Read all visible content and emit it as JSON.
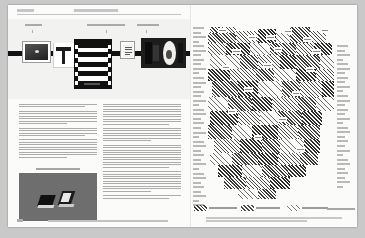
{
  "document": {
    "type": "printed-journal-spread",
    "page_number": "108",
    "running_header_left": "Chapter 04",
    "running_header_center": "Interface as Artifact",
    "footer_text": "Design Research Quarterly — Volume 12, Number 3 — Material Histories of the Interface",
    "background_color": "#c9c9c9",
    "paper_color": "#fbfbfa",
    "ink_color": "#111111"
  },
  "left_page": {
    "timeline": {
      "name": "artifact-timeline-strip",
      "axis_color": "#111111",
      "labels": [
        {
          "text": "1946-58",
          "x": 17
        },
        {
          "text": "1959-72 · transition era",
          "x": 79
        },
        {
          "text": "1973-84",
          "x": 129
        }
      ],
      "items": [
        {
          "name": "framed-photograph",
          "caption": "Plate 1"
        },
        {
          "name": "t-shaped-object",
          "caption": "Plate 2"
        },
        {
          "name": "striped-panel",
          "caption": "Plate 3"
        },
        {
          "name": "index-card",
          "caption": "Plate 4"
        },
        {
          "name": "device-photograph",
          "caption": "Plate 5"
        }
      ]
    },
    "columns": [
      {
        "name": "body-column-left",
        "paragraphs": [
          {
            "lines": 2,
            "last": "mid"
          },
          {
            "lines": 6,
            "last": "short"
          },
          {
            "lines": 4,
            "last": "mid"
          },
          {
            "lines": 8,
            "last": "short"
          }
        ]
      },
      {
        "name": "body-column-right",
        "paragraphs": [
          {
            "lines": 9,
            "last": "mid"
          },
          {
            "lines": 6,
            "last": "short"
          },
          {
            "lines": 10,
            "last": "mid"
          },
          {
            "lines": 9,
            "last": "short"
          },
          {
            "lines": 2,
            "last": "mid"
          }
        ]
      }
    ],
    "figure": {
      "name": "figure-photograph",
      "caption": "Figure 4.2 — Comparative housings",
      "background_color": "#6e6e6e"
    }
  },
  "right_page": {
    "matrix": {
      "name": "hatched-matrix-diagram",
      "row_label_count": 40,
      "right_label_count": 32
    },
    "legend": {
      "items": [
        {
          "label": "Primary sequence",
          "density": "dense"
        },
        {
          "label": "Secondary set",
          "density": "medium"
        },
        {
          "label": "Peripheral range",
          "density": "light"
        }
      ],
      "right_note": "Source: author survey"
    },
    "caption": "Figure 4.3 — Distribution matrix of recorded artifact types across the survey period, grouped by production cohort."
  },
  "chart_data": {
    "type": "heatmap",
    "xlabel": "",
    "ylabel": "",
    "grid": false,
    "legend_position": "bottom-left",
    "legend": [
      "Primary sequence",
      "Secondary set",
      "Peripheral range"
    ],
    "cells": [
      {
        "x": 2,
        "y": 0,
        "w": 10,
        "h": 6,
        "d": "d2"
      },
      {
        "x": 12,
        "y": 0,
        "w": 16,
        "h": 6,
        "d": ""
      },
      {
        "x": 0,
        "y": 6,
        "w": 28,
        "h": 10,
        "d": "d2"
      },
      {
        "x": 28,
        "y": 4,
        "w": 22,
        "h": 12,
        "d": ""
      },
      {
        "x": 50,
        "y": 2,
        "w": 18,
        "h": 14,
        "d": "d3"
      },
      {
        "x": 68,
        "y": 6,
        "w": 14,
        "h": 10,
        "d": "lite"
      },
      {
        "x": 82,
        "y": 0,
        "w": 20,
        "h": 16,
        "d": "d2"
      },
      {
        "x": 102,
        "y": 4,
        "w": 16,
        "h": 12,
        "d": ""
      },
      {
        "x": 0,
        "y": 16,
        "w": 18,
        "h": 12,
        "d": ""
      },
      {
        "x": 18,
        "y": 16,
        "w": 24,
        "h": 12,
        "d": "d3"
      },
      {
        "x": 42,
        "y": 16,
        "w": 20,
        "h": 12,
        "d": "lite"
      },
      {
        "x": 62,
        "y": 16,
        "w": 26,
        "h": 12,
        "d": "d2"
      },
      {
        "x": 88,
        "y": 16,
        "w": 18,
        "h": 12,
        "d": ""
      },
      {
        "x": 106,
        "y": 16,
        "w": 18,
        "h": 12,
        "d": "d3"
      },
      {
        "x": 2,
        "y": 28,
        "w": 30,
        "h": 14,
        "d": "lite"
      },
      {
        "x": 32,
        "y": 28,
        "w": 18,
        "h": 14,
        "d": "d2"
      },
      {
        "x": 50,
        "y": 28,
        "w": 22,
        "h": 14,
        "d": ""
      },
      {
        "x": 72,
        "y": 28,
        "w": 16,
        "h": 14,
        "d": "d3"
      },
      {
        "x": 88,
        "y": 28,
        "w": 24,
        "h": 14,
        "d": "d2"
      },
      {
        "x": 112,
        "y": 28,
        "w": 14,
        "h": 14,
        "d": "lite"
      },
      {
        "x": 0,
        "y": 42,
        "w": 22,
        "h": 12,
        "d": "d3"
      },
      {
        "x": 22,
        "y": 42,
        "w": 26,
        "h": 12,
        "d": ""
      },
      {
        "x": 48,
        "y": 42,
        "w": 18,
        "h": 12,
        "d": "d2"
      },
      {
        "x": 66,
        "y": 42,
        "w": 22,
        "h": 12,
        "d": "lite"
      },
      {
        "x": 88,
        "y": 42,
        "w": 20,
        "h": 12,
        "d": "d3"
      },
      {
        "x": 108,
        "y": 42,
        "w": 18,
        "h": 12,
        "d": ""
      },
      {
        "x": 4,
        "y": 54,
        "w": 26,
        "h": 16,
        "d": "d2"
      },
      {
        "x": 30,
        "y": 54,
        "w": 20,
        "h": 16,
        "d": "d3"
      },
      {
        "x": 50,
        "y": 54,
        "w": 24,
        "h": 16,
        "d": "lite"
      },
      {
        "x": 74,
        "y": 54,
        "w": 18,
        "h": 16,
        "d": "d2"
      },
      {
        "x": 92,
        "y": 54,
        "w": 22,
        "h": 16,
        "d": ""
      },
      {
        "x": 114,
        "y": 54,
        "w": 12,
        "h": 16,
        "d": "d3"
      },
      {
        "x": 0,
        "y": 70,
        "w": 20,
        "h": 14,
        "d": "lite"
      },
      {
        "x": 20,
        "y": 70,
        "w": 24,
        "h": 14,
        "d": "d2"
      },
      {
        "x": 44,
        "y": 70,
        "w": 20,
        "h": 14,
        "d": "d3"
      },
      {
        "x": 64,
        "y": 70,
        "w": 26,
        "h": 14,
        "d": ""
      },
      {
        "x": 90,
        "y": 70,
        "w": 18,
        "h": 14,
        "d": "d2"
      },
      {
        "x": 108,
        "y": 70,
        "w": 18,
        "h": 14,
        "d": "lite"
      },
      {
        "x": 2,
        "y": 84,
        "w": 28,
        "h": 14,
        "d": "d3"
      },
      {
        "x": 30,
        "y": 84,
        "w": 22,
        "h": 14,
        "d": ""
      },
      {
        "x": 52,
        "y": 84,
        "w": 18,
        "h": 14,
        "d": "lite"
      },
      {
        "x": 70,
        "y": 84,
        "w": 24,
        "h": 14,
        "d": "d2"
      },
      {
        "x": 94,
        "y": 84,
        "w": 20,
        "h": 14,
        "d": "d3"
      },
      {
        "x": 0,
        "y": 98,
        "w": 24,
        "h": 14,
        "d": "d2"
      },
      {
        "x": 24,
        "y": 98,
        "w": 20,
        "h": 14,
        "d": "lite"
      },
      {
        "x": 44,
        "y": 98,
        "w": 26,
        "h": 14,
        "d": "d3"
      },
      {
        "x": 70,
        "y": 98,
        "w": 20,
        "h": 14,
        "d": ""
      },
      {
        "x": 90,
        "y": 98,
        "w": 22,
        "h": 14,
        "d": "d2"
      },
      {
        "x": 6,
        "y": 112,
        "w": 26,
        "h": 14,
        "d": ""
      },
      {
        "x": 32,
        "y": 112,
        "w": 22,
        "h": 14,
        "d": "d3"
      },
      {
        "x": 54,
        "y": 112,
        "w": 18,
        "h": 14,
        "d": "d2"
      },
      {
        "x": 72,
        "y": 112,
        "w": 24,
        "h": 14,
        "d": "lite"
      },
      {
        "x": 96,
        "y": 112,
        "w": 16,
        "h": 14,
        "d": "d3"
      },
      {
        "x": 2,
        "y": 126,
        "w": 22,
        "h": 12,
        "d": "lite"
      },
      {
        "x": 24,
        "y": 126,
        "w": 26,
        "h": 12,
        "d": "d2"
      },
      {
        "x": 50,
        "y": 126,
        "w": 20,
        "h": 12,
        "d": "d3"
      },
      {
        "x": 70,
        "y": 126,
        "w": 22,
        "h": 12,
        "d": ""
      },
      {
        "x": 92,
        "y": 126,
        "w": 18,
        "h": 12,
        "d": "d2"
      },
      {
        "x": 10,
        "y": 138,
        "w": 24,
        "h": 12,
        "d": "d3"
      },
      {
        "x": 34,
        "y": 138,
        "w": 20,
        "h": 12,
        "d": "lite"
      },
      {
        "x": 54,
        "y": 138,
        "w": 26,
        "h": 12,
        "d": "d2"
      },
      {
        "x": 80,
        "y": 138,
        "w": 18,
        "h": 12,
        "d": "d3"
      },
      {
        "x": 16,
        "y": 150,
        "w": 22,
        "h": 12,
        "d": "d2"
      },
      {
        "x": 38,
        "y": 150,
        "w": 24,
        "h": 12,
        "d": ""
      },
      {
        "x": 62,
        "y": 150,
        "w": 20,
        "h": 12,
        "d": "d3"
      },
      {
        "x": 30,
        "y": 162,
        "w": 20,
        "h": 10,
        "d": "lite"
      },
      {
        "x": 50,
        "y": 162,
        "w": 18,
        "h": 10,
        "d": "d2"
      }
    ],
    "callouts": [
      {
        "x": 10,
        "y": 1,
        "w": 9,
        "h": 5
      },
      {
        "x": 40,
        "y": 8,
        "w": 8,
        "h": 5
      },
      {
        "x": 58,
        "y": 8,
        "w": 9,
        "h": 5
      },
      {
        "x": 76,
        "y": 2,
        "w": 8,
        "h": 5
      },
      {
        "x": 95,
        "y": 10,
        "w": 9,
        "h": 5
      },
      {
        "x": 113,
        "y": 1,
        "w": 8,
        "h": 5
      },
      {
        "x": 24,
        "y": 22,
        "w": 9,
        "h": 5
      },
      {
        "x": 66,
        "y": 20,
        "w": 8,
        "h": 5
      },
      {
        "x": 104,
        "y": 22,
        "w": 9,
        "h": 5
      },
      {
        "x": 14,
        "y": 38,
        "w": 8,
        "h": 5
      },
      {
        "x": 55,
        "y": 36,
        "w": 9,
        "h": 5
      },
      {
        "x": 98,
        "y": 40,
        "w": 8,
        "h": 5
      },
      {
        "x": 36,
        "y": 60,
        "w": 9,
        "h": 5
      },
      {
        "x": 84,
        "y": 64,
        "w": 8,
        "h": 5
      },
      {
        "x": 20,
        "y": 82,
        "w": 8,
        "h": 5
      },
      {
        "x": 70,
        "y": 90,
        "w": 9,
        "h": 5
      },
      {
        "x": 46,
        "y": 108,
        "w": 8,
        "h": 5
      },
      {
        "x": 88,
        "y": 120,
        "w": 9,
        "h": 5
      }
    ]
  }
}
